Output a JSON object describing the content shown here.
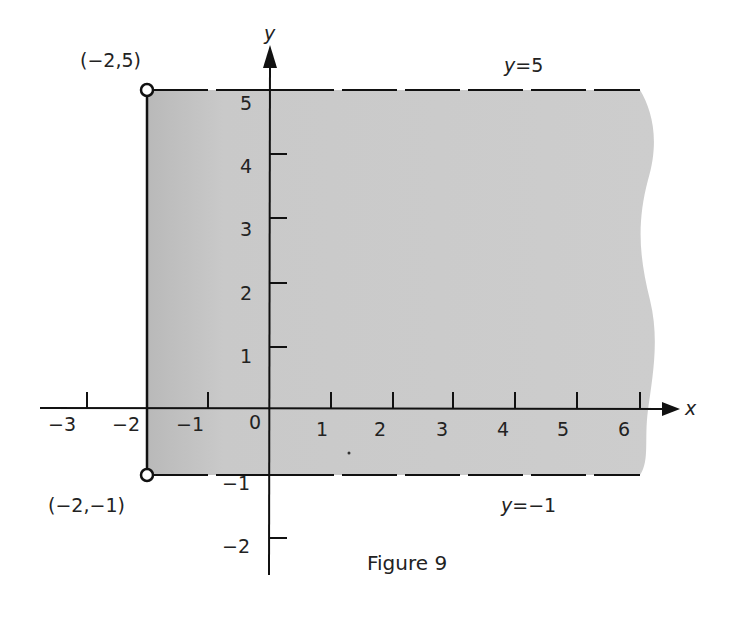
{
  "figure": {
    "caption": "Figure 9",
    "region": {
      "description": "Shaded region: x >= -2 (solid boundary), -1 < y < 5 (dashed boundaries), extending right",
      "fill_color": "#c8c8c8",
      "x_min": -2,
      "y_min": -1,
      "y_max": 5
    },
    "axes": {
      "x_label": "x",
      "y_label": "y",
      "x_ticks": [
        {
          "value": -3,
          "label": "−3"
        },
        {
          "value": -2,
          "label": "−2"
        },
        {
          "value": -1,
          "label": "−1"
        },
        {
          "value": 0,
          "label": "0"
        },
        {
          "value": 1,
          "label": "1"
        },
        {
          "value": 2,
          "label": "2"
        },
        {
          "value": 3,
          "label": "3"
        },
        {
          "value": 4,
          "label": "4"
        },
        {
          "value": 5,
          "label": "5"
        },
        {
          "value": 6,
          "label": "6"
        }
      ],
      "y_ticks": [
        {
          "value": 5,
          "label": "5"
        },
        {
          "value": 4,
          "label": "4"
        },
        {
          "value": 3,
          "label": "3"
        },
        {
          "value": 2,
          "label": "2"
        },
        {
          "value": 1,
          "label": "1"
        },
        {
          "value": -1,
          "label": "−1"
        },
        {
          "value": -2,
          "label": "−2"
        }
      ]
    },
    "boundary_lines": [
      {
        "equation": "y=5",
        "label": "y=5",
        "style": "dashed"
      },
      {
        "equation": "y=−1",
        "label": "y=−1",
        "style": "dashed"
      },
      {
        "equation": "x=−2",
        "label": "",
        "style": "solid"
      }
    ],
    "points": [
      {
        "coords": [
          -2,
          5
        ],
        "label": "(−2,5)",
        "style": "open-circle"
      },
      {
        "coords": [
          -2,
          -1
        ],
        "label": "(−2,−1)",
        "style": "open-circle"
      }
    ]
  }
}
